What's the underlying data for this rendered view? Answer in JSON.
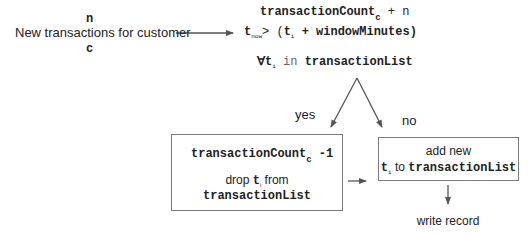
{
  "input": {
    "var_n": "n",
    "label": "New transactions for customer",
    "var_c": "c"
  },
  "condition": {
    "line1_var": "transactionCount",
    "line1_sub": "c",
    "line1_tail": " + n",
    "line2_t": "t",
    "line2_now": "now",
    "line2_gt": "> (",
    "line2_ti": "t",
    "line2_i": "i",
    "line2_tail": " + windowMinutes)",
    "line3_forall": "∀",
    "line3_t": "t",
    "line3_i": "i",
    "line3_in": " in ",
    "line3_list": "transactionList"
  },
  "branches": {
    "yes_label": "yes",
    "no_label": "no"
  },
  "yes_box": {
    "count_var": "transactionCount",
    "count_sub": "c",
    "count_op": " -1",
    "drop_prefix": "drop ",
    "drop_t": "t",
    "drop_i": "i",
    "drop_suffix": " from",
    "drop_list": "transactionList"
  },
  "no_box": {
    "line1": "add new",
    "t": "t",
    "i": "i",
    "to": " to ",
    "list": "transactionList"
  },
  "final": {
    "label": "write record"
  },
  "colors": {
    "line": "#555555",
    "border": "#7a7a7a",
    "text": "#222222"
  }
}
